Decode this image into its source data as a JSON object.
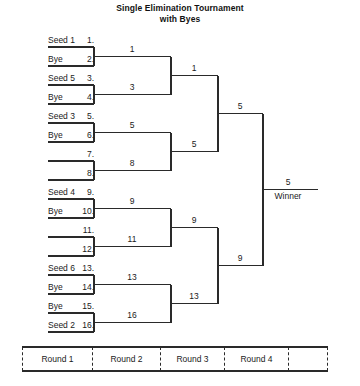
{
  "title": {
    "line1": "Single Elimination Tournament",
    "line2": "with Byes"
  },
  "bracket": {
    "round1_entries": [
      {
        "num": "1.",
        "label": "Seed 1"
      },
      {
        "num": "2.",
        "label": "Bye"
      },
      {
        "num": "3.",
        "label": "Seed 5"
      },
      {
        "num": "4.",
        "label": "Bye"
      },
      {
        "num": "5.",
        "label": "Seed 3"
      },
      {
        "num": "6.",
        "label": "Bye"
      },
      {
        "num": "7.",
        "label": ""
      },
      {
        "num": "8.",
        "label": ""
      },
      {
        "num": "9.",
        "label": "Seed 4"
      },
      {
        "num": "10.",
        "label": "Bye"
      },
      {
        "num": "11.",
        "label": ""
      },
      {
        "num": "12.",
        "label": ""
      },
      {
        "num": "13.",
        "label": "Seed 6"
      },
      {
        "num": "14.",
        "label": "Bye"
      },
      {
        "num": "15.",
        "label": "Bye"
      },
      {
        "num": "16.",
        "label": "Seed 2"
      }
    ],
    "round2_slots": [
      "1",
      "3",
      "5",
      "8",
      "9",
      "11",
      "13",
      "16"
    ],
    "round3_slots": [
      "1",
      "5",
      "9",
      "13"
    ],
    "round4_slots": [
      "5",
      "9"
    ],
    "final_slot": "5",
    "winner_label": "Winner"
  },
  "legend": {
    "cells": [
      "Round 1",
      "Round 2",
      "Round 3",
      "Round 4",
      ""
    ]
  },
  "colors": {
    "line": "#2a2a2a",
    "text": "#1a1a1a",
    "background": "#ffffff"
  }
}
